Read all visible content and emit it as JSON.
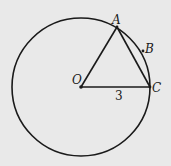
{
  "diagram": {
    "background": "#e9e9e9",
    "stroke_color": "#1a1a1a",
    "circle": {
      "center": "O",
      "cx": 81,
      "cy": 87,
      "r": 69
    },
    "points": {
      "O": {
        "label": "O",
        "x": 81,
        "y": 87
      },
      "A": {
        "label": "A",
        "x": 117,
        "y": 27
      },
      "B": {
        "label": "B",
        "x": 143,
        "y": 51
      },
      "C": {
        "label": "C",
        "x": 150,
        "y": 87
      }
    },
    "segments": [
      {
        "from": "O",
        "to": "A"
      },
      {
        "from": "O",
        "to": "C"
      },
      {
        "from": "A",
        "to": "C"
      }
    ],
    "measurements": {
      "OC_label": "3"
    }
  }
}
